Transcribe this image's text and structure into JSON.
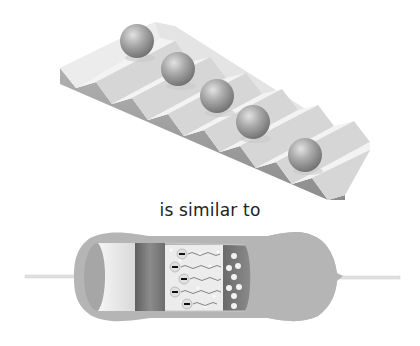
{
  "diagram": {
    "top_figure": {
      "subject": "balls-on-staircase",
      "ball_count": 5,
      "step_count": 8
    },
    "caption": "is similar to",
    "bottom_figure": {
      "subject": "resistor-cutaway",
      "charge_symbol": "−",
      "electron_count": 5,
      "hole_count": 8
    },
    "colors": {
      "stair_top": "#e6e6e6",
      "stair_riser": "#d2d2d2",
      "stair_side": "#a3a3a3",
      "ball": "#9e9e9e",
      "resistor_body": "#b4b4b4",
      "resistor_core_light": "#e9e9e9",
      "resistor_core_dark": "#7a7a7a",
      "lead": "#e2e2e2"
    }
  }
}
